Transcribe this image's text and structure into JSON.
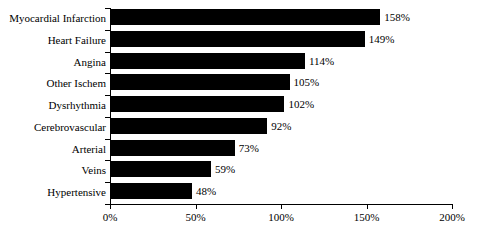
{
  "chart_data": {
    "type": "bar",
    "orientation": "horizontal",
    "title": "",
    "subtitle": "",
    "xlabel": "",
    "ylabel": "",
    "categories": [
      "Myocardial Infarction",
      "Heart Failure",
      "Angina",
      "Other Ischem",
      "Dysrhythmia",
      "Cerebrovascular",
      "Arterial",
      "Veins",
      "Hypertensive"
    ],
    "values": [
      158,
      149,
      114,
      105,
      102,
      92,
      73,
      59,
      48
    ],
    "value_labels": [
      "158%",
      "149%",
      "114%",
      "105%",
      "102%",
      "92%",
      "73%",
      "59%",
      "48%"
    ],
    "xlim": [
      0,
      200
    ],
    "xticks": [
      0,
      50,
      100,
      150,
      200
    ],
    "xtick_labels": [
      "0%",
      "50%",
      "100%",
      "150%",
      "200%"
    ],
    "grid": false,
    "legend": false,
    "bar_color": "#000000",
    "axis_color": "#000000",
    "background_color": "#ffffff"
  }
}
